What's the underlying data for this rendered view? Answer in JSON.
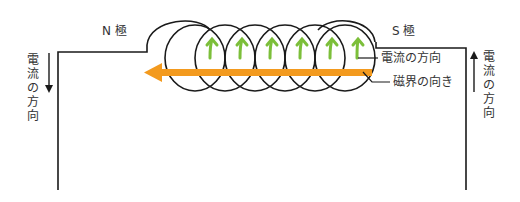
{
  "diagram": {
    "type": "solenoid-magnetic-field",
    "labels": {
      "north_pole": "N 極",
      "south_pole": "S 極",
      "current_direction": "電流の方向",
      "magnetic_field_direction": "磁界の向き",
      "left_wire_current": "電流の方向",
      "right_wire_current": "電流の方向"
    },
    "coil": {
      "turns": 6
    },
    "arrows": {
      "left_wire": "down",
      "right_wire": "up",
      "magnetic_field": "left",
      "current_on_coil": "up"
    },
    "colors": {
      "wire": "#1a1a1a",
      "field_arrow": "#f39a1e",
      "current_arrow": "#7cbf3a",
      "text": "#333333"
    }
  }
}
